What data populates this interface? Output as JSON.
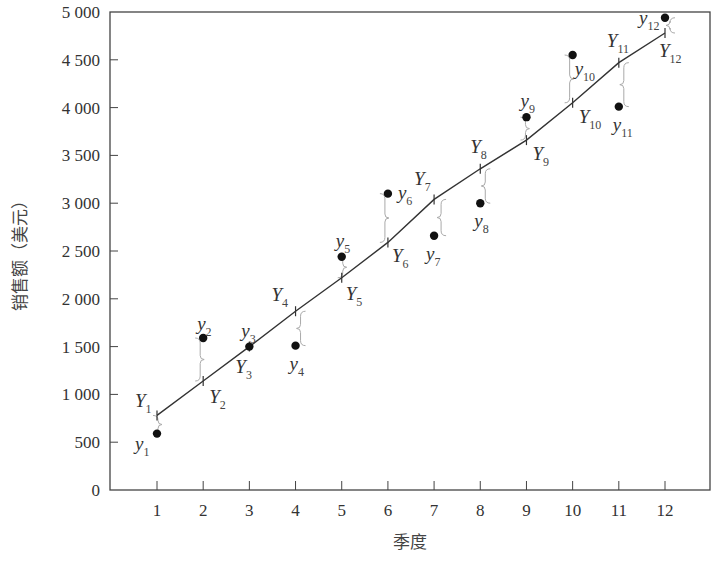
{
  "chart_data": {
    "type": "scatter",
    "title": "",
    "xlabel": "季度",
    "ylabel": "销售额（美元）",
    "xlim": [
      0,
      13
    ],
    "ylim": [
      0,
      5000
    ],
    "x_ticks": [
      1,
      2,
      3,
      4,
      5,
      6,
      7,
      8,
      9,
      10,
      11,
      12
    ],
    "y_ticks": [
      0,
      500,
      1000,
      1500,
      2000,
      2500,
      3000,
      3500,
      4000,
      4500,
      5000
    ],
    "y_tick_labels": [
      "0",
      "500",
      "1 000",
      "1 500",
      "2 000",
      "2 500",
      "3 000",
      "3 500",
      "4 000",
      "4 500",
      "5 000"
    ],
    "grid": false,
    "legend": null,
    "series": [
      {
        "name": "actual sales (y)",
        "marker": "filled-circle",
        "x": [
          1,
          2,
          3,
          4,
          5,
          6,
          7,
          8,
          9,
          10,
          11,
          12
        ],
        "values": [
          590,
          1590,
          1500,
          1510,
          2440,
          3100,
          2660,
          3000,
          3900,
          4550,
          4010,
          4940
        ],
        "labels": [
          "y1",
          "y2",
          "y3",
          "y4",
          "y5",
          "y6",
          "y7",
          "y8",
          "y9",
          "y10",
          "y11",
          "y12"
        ]
      },
      {
        "name": "fitted trend line (Y)",
        "type": "line",
        "x": [
          1,
          2,
          3,
          4,
          5,
          6,
          7,
          8,
          9,
          10,
          11,
          12
        ],
        "values": [
          780,
          1140,
          1500,
          1870,
          2220,
          2590,
          3040,
          3360,
          3660,
          4050,
          4470,
          4780
        ],
        "labels": [
          "Y1",
          "Y2",
          "Y3",
          "Y4",
          "Y5",
          "Y6",
          "Y7",
          "Y8",
          "Y9",
          "Y10",
          "Y11",
          "Y12"
        ]
      }
    ],
    "annotations": "Curly braces mark the vertical deviation between each actual point y_i and the fitted value Y_i"
  }
}
